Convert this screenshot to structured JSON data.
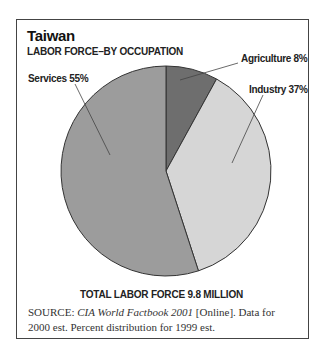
{
  "header": {
    "title": "Taiwan",
    "subtitle": "LABOR FORCE–BY OCCUPATION"
  },
  "chart_data": {
    "type": "pie",
    "title": "Taiwan",
    "subtitle": "LABOR FORCE–BY OCCUPATION",
    "categories": [
      "Agriculture",
      "Industry",
      "Services"
    ],
    "values": [
      8,
      37,
      55
    ],
    "labels": [
      "Agriculture 8%",
      "Industry 37%",
      "Services 55%"
    ],
    "colors": [
      "#6e6e6e",
      "#d6d6d6",
      "#9c9c9c"
    ],
    "start_angle": "top, clockwise",
    "annotation": "TOTAL LABOR FORCE 9.8 MILLION"
  },
  "footer": {
    "total": "TOTAL LABOR FORCE 9.8 MILLION",
    "source_label": "SOURCE:",
    "source_title": "CIA World Factbook 2001",
    "source_rest": " [Online]. Data for 2000 est. Percent distribution for 1999 est."
  }
}
